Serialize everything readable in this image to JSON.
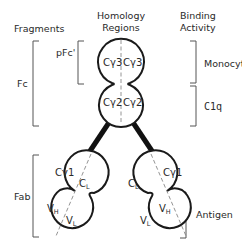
{
  "headers": {
    "fragments": "Fragments",
    "homology_line1": "Homology",
    "homology_line2": "Regions",
    "binding_line1": "Binding",
    "binding_line2": "Activity"
  },
  "fragments": {
    "fc": "Fc",
    "pfc": "pFc'",
    "fab": "Fab"
  },
  "binding": {
    "monocyte": "Monocyte",
    "c1q": "C1q",
    "antigen": "Antigen"
  },
  "domains": {
    "fc_top_left": "Cγ3",
    "fc_top_right": "Cγ3",
    "fc_mid_left": "Cγ2",
    "fc_mid_right": "Cγ2",
    "left_fab_cg1": "Cγ1",
    "left_fab_cl_main": "C",
    "left_fab_cl_sub": "L",
    "left_fab_vh_main": "V",
    "left_fab_vh_sub": "H",
    "left_fab_vl_main": "V",
    "left_fab_vl_sub": "L",
    "right_fab_cg1": "Cγ1",
    "right_fab_cl_main": "C",
    "right_fab_cl_sub": "L",
    "right_fab_vh_main": "V",
    "right_fab_vh_sub": "H",
    "right_fab_vl_main": "V",
    "right_fab_vl_sub": "L"
  },
  "colors": {
    "outline": "#1a1a1a",
    "text": "#2a2a2a",
    "bracket": "#555555",
    "dashed": "#888888"
  }
}
